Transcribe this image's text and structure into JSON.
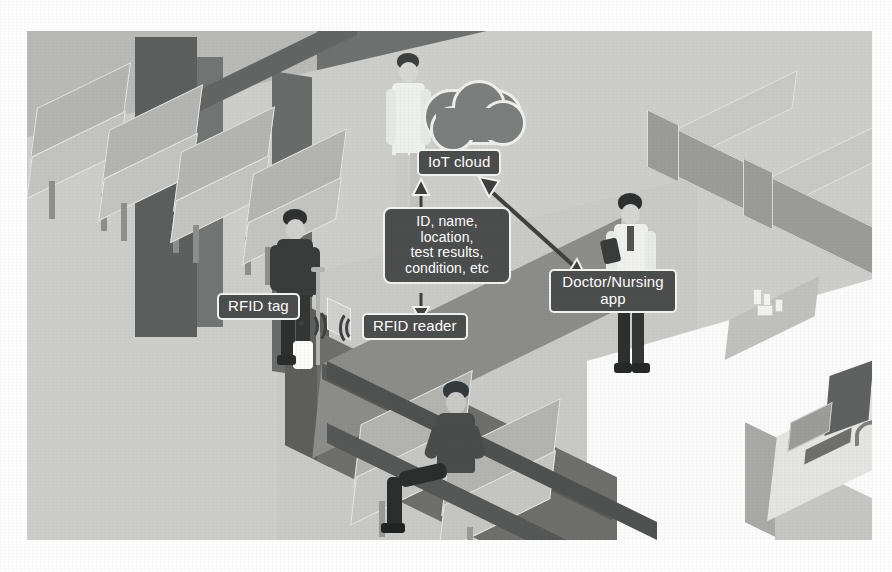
{
  "figure": {
    "domain": "Diagram",
    "caption": ""
  },
  "colors": {
    "label_fill": "#4c4d4d",
    "label_border": "#f2f2f0",
    "label_text": "#ffffff",
    "cloud_fill": "#7c7d7d",
    "arrow": "#3f4040",
    "floor_light": "#cdcdcb",
    "wall_dark": "#6f7070",
    "wall_mid": "#b9bab8",
    "floor_white": "#fafafa",
    "page_background": "#ffffff"
  },
  "diagram": {
    "nodes": [
      {
        "id": "iot-cloud",
        "label": "IoT cloud",
        "icon": "cloud-icon",
        "x": 390,
        "y": 120,
        "width": 96,
        "height": 28
      },
      {
        "id": "data-payload",
        "label": "ID, name,\nlocation,\ntest results,\ncondition, etc",
        "lines": [
          "ID, name,",
          "location,",
          "test results,",
          "condition, etc"
        ],
        "x": 358,
        "y": 178,
        "width": 124,
        "height": 78
      },
      {
        "id": "rfid-tag",
        "label": "RFID tag",
        "x": 190,
        "y": 262,
        "width": 92,
        "height": 28
      },
      {
        "id": "rfid-reader",
        "label": "RFID reader",
        "x": 335,
        "y": 282,
        "width": 118,
        "height": 28
      },
      {
        "id": "doctor-nursing-app",
        "label": "Doctor/Nursing app",
        "lines": [
          "Doctor/Nursing",
          "app"
        ],
        "x": 522,
        "y": 238,
        "width": 124,
        "height": 48
      }
    ],
    "edges": [
      {
        "id": "reader-to-payload",
        "from": "rfid-reader",
        "to": "data-payload",
        "direction": "up",
        "style": "solid",
        "arrowhead": "triangle"
      },
      {
        "id": "payload-to-cloud",
        "from": "data-payload",
        "to": "iot-cloud",
        "direction": "up",
        "style": "solid",
        "arrowhead": "triangle"
      },
      {
        "id": "cloud-to-app",
        "from": "iot-cloud",
        "to": "doctor-nursing-app",
        "direction": "bidirectional",
        "style": "solid",
        "arrowhead": "triangle-both"
      },
      {
        "id": "tag-to-reader",
        "from": "rfid-tag",
        "to": "rfid-reader",
        "direction": "right",
        "style": "rf-waves",
        "arrowhead": "none"
      }
    ],
    "rf_waves": {
      "label": "radio-signal-icon",
      "emitter_x": 276,
      "emitter_y": 292,
      "receiver_x": 318,
      "receiver_y": 295
    }
  },
  "scene": {
    "description": "Isometric hospital waiting area and reception",
    "people": [
      {
        "id": "doctor-standing",
        "role": "Doctor in white coat near cloud",
        "x": 352,
        "y": 22
      },
      {
        "id": "patient-crutch",
        "role": "Patient with leg cast on crutch wearing RFID tag",
        "x": 240,
        "y": 178
      },
      {
        "id": "nurse-tablet",
        "role": "Nurse holding tablet device",
        "x": 575,
        "y": 162
      },
      {
        "id": "patient-seated",
        "role": "Patient seated on waiting bench",
        "x": 390,
        "y": 350
      }
    ],
    "furniture": [
      {
        "id": "waiting-chairs-left",
        "label": "row of waiting chairs"
      },
      {
        "id": "waiting-bench-mid",
        "label": "waiting bench"
      },
      {
        "id": "reception-counter",
        "label": "reception counter with RFID reader"
      },
      {
        "id": "wall-cabinets",
        "label": "wall-mounted cabinets"
      },
      {
        "id": "reception-desk",
        "label": "reception desk with monitor and printer"
      },
      {
        "id": "side-table",
        "label": "side table with bottles"
      }
    ]
  }
}
